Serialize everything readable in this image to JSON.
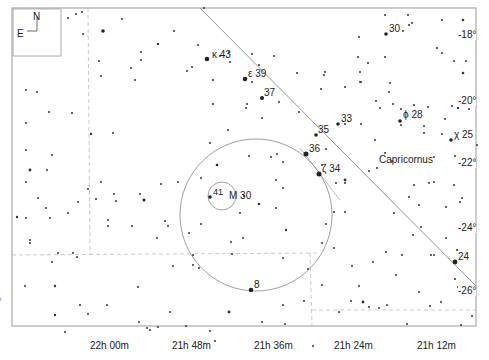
{
  "map": {
    "constellation": "Capricornus",
    "object": "M 30",
    "object_star": "41",
    "credit": "Megastar",
    "compass": {
      "north": "N",
      "east": "E"
    }
  },
  "ra_labels": [
    "22h 00m",
    "21h 48m",
    "21h 36m",
    "21h 24m",
    "21h 12m"
  ],
  "dec_labels": [
    "-18°",
    "-20°",
    "-22°",
    "-24°",
    "-26°"
  ],
  "star_labels": [
    {
      "id": "kappa",
      "text": "κ 43"
    },
    {
      "id": "epsilon",
      "text": "ε 39"
    },
    {
      "id": "37",
      "text": "37"
    },
    {
      "id": "35",
      "text": "35"
    },
    {
      "id": "33",
      "text": "33"
    },
    {
      "id": "36",
      "text": "36"
    },
    {
      "id": "zeta",
      "text": "ζ 34"
    },
    {
      "id": "phi",
      "text": "ϕ 28"
    },
    {
      "id": "chi",
      "text": "χ 25"
    },
    {
      "id": "30",
      "text": "30"
    },
    {
      "id": "24",
      "text": "24"
    },
    {
      "id": "8",
      "text": "8"
    }
  ],
  "colors": {
    "ink": "#222222",
    "line": "#999999",
    "grid": "#bbbbbb"
  }
}
